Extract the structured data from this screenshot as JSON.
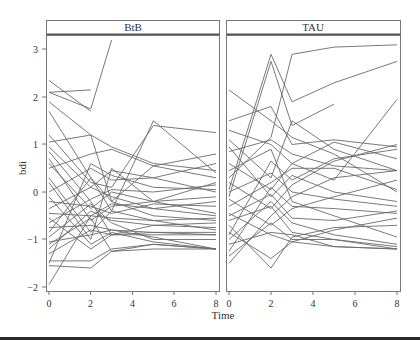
{
  "chart_data": {
    "type": "line",
    "title": "",
    "xlabel": "Time",
    "ylabel": "bdi",
    "xlim": [
      0,
      8
    ],
    "ylim": [
      -2.1,
      3.3
    ],
    "xticks": [
      0,
      2,
      4,
      6,
      8
    ],
    "yticks": [
      -2,
      -1,
      0,
      1,
      2,
      3
    ],
    "grid": false,
    "legend": "none",
    "panels": [
      {
        "label": "BtB",
        "x": [
          0,
          2,
          3,
          5,
          8
        ],
        "series": [
          [
            2.1,
            1.75,
            3.2,
            null,
            null
          ],
          [
            2.35,
            1.7,
            null,
            null,
            null
          ],
          [
            2.1,
            2.15,
            null,
            null,
            null
          ],
          [
            1.9,
            1.2,
            0.95,
            0.6,
            0.45
          ],
          [
            1.7,
            0.3,
            -0.4,
            1.5,
            0.4
          ],
          [
            1.2,
            0.2,
            0.1,
            1.4,
            1.25
          ],
          [
            1.05,
            1.2,
            -0.2,
            0.55,
            0.3
          ],
          [
            0.85,
            -0.2,
            -0.9,
            -0.7,
            -0.75
          ],
          [
            0.7,
            -0.6,
            -0.3,
            -0.2,
            -0.1
          ],
          [
            0.5,
            0.8,
            0.9,
            0.55,
            0.8
          ],
          [
            0.3,
            -0.85,
            -0.4,
            -0.6,
            -0.8
          ],
          [
            0.2,
            -1.0,
            0.5,
            -0.2,
            0.2
          ],
          [
            0.0,
            0.5,
            0.25,
            0.3,
            0.0
          ],
          [
            -0.1,
            -1.1,
            -0.85,
            -1.05,
            -1.2
          ],
          [
            -0.2,
            -0.3,
            -0.45,
            -0.25,
            -0.3
          ],
          [
            -0.35,
            0.1,
            -0.1,
            -0.35,
            -0.5
          ],
          [
            -0.45,
            -0.5,
            -0.55,
            -0.6,
            -0.55
          ],
          [
            -0.55,
            -1.2,
            -0.9,
            -0.9,
            -0.9
          ],
          [
            -0.65,
            -0.15,
            0.05,
            0.0,
            0.15
          ],
          [
            -0.75,
            -0.7,
            -0.8,
            -0.85,
            -0.9
          ],
          [
            -0.85,
            0.3,
            -0.2,
            -0.5,
            -0.6
          ],
          [
            -0.95,
            -0.25,
            -0.65,
            -1.0,
            -1.0
          ],
          [
            -1.05,
            -0.9,
            -0.8,
            -0.95,
            -1.2
          ],
          [
            -1.1,
            -0.55,
            -1.25,
            -1.1,
            -1.2
          ],
          [
            -1.2,
            -0.4,
            -0.6,
            -0.7,
            -0.65
          ],
          [
            -1.3,
            -0.8,
            -0.9,
            -0.85,
            -0.85
          ],
          [
            -1.45,
            -1.45,
            -1.2,
            -1.1,
            -1.2
          ],
          [
            -1.55,
            -1.6,
            -1.25,
            -1.2,
            -1.2
          ],
          [
            -1.5,
            0.6,
            0.35,
            0.1,
            0.05
          ],
          [
            -1.95,
            -0.5,
            -0.25,
            -0.35,
            -0.2
          ],
          [
            0.6,
            -0.35,
            0.0,
            -0.2,
            -0.45
          ],
          [
            0.95,
            0.1,
            0.45,
            0.3,
            0.6
          ]
        ]
      },
      {
        "label": "TAU",
        "x": [
          0,
          2,
          3,
          5,
          8
        ],
        "series": [
          [
            0.3,
            1.15,
            2.9,
            3.05,
            3.1
          ],
          [
            0.05,
            2.9,
            1.9,
            2.3,
            2.75
          ],
          [
            -0.1,
            2.75,
            1.4,
            1.85,
            null
          ],
          [
            2.15,
            1.5,
            1.15,
            0.8,
            0.0
          ],
          [
            1.5,
            1.8,
            1.0,
            1.1,
            0.95
          ],
          [
            1.3,
            1.0,
            0.6,
            0.25,
            1.95
          ],
          [
            1.1,
            0.3,
            1.5,
            0.9,
            0.45
          ],
          [
            0.85,
            1.1,
            0.8,
            0.55,
            0.45
          ],
          [
            0.6,
            0.05,
            0.6,
            1.05,
            0.7
          ],
          [
            0.45,
            0.9,
            -0.2,
            -0.5,
            -0.95
          ],
          [
            0.2,
            -0.35,
            0.15,
            0.65,
            1.0
          ],
          [
            0.0,
            0.4,
            0.0,
            -0.15,
            -0.3
          ],
          [
            -0.15,
            -0.7,
            -0.35,
            -0.1,
            0.25
          ],
          [
            -0.3,
            0.2,
            0.5,
            0.5,
            0.05
          ],
          [
            -0.45,
            -0.9,
            -1.05,
            -1.15,
            -1.2
          ],
          [
            -0.6,
            -0.3,
            -0.85,
            -1.0,
            -1.15
          ],
          [
            -0.7,
            -1.6,
            -0.95,
            -0.75,
            -0.7
          ],
          [
            -0.85,
            -1.4,
            -1.05,
            -0.8,
            -0.55
          ],
          [
            -1.0,
            -0.2,
            -0.65,
            -0.9,
            -1.1
          ],
          [
            -1.1,
            -0.85,
            -0.9,
            -1.15,
            -1.2
          ],
          [
            -1.25,
            0.1,
            -0.3,
            -0.35,
            -0.45
          ],
          [
            -1.35,
            -0.65,
            -1.0,
            -1.0,
            -1.2
          ],
          [
            -1.5,
            -0.5,
            -0.1,
            0.3,
            0.45
          ],
          [
            -0.5,
            -0.05,
            -0.55,
            -0.6,
            -0.4
          ],
          [
            0.95,
            -0.1,
            0.35,
            0.0,
            -0.2
          ],
          [
            -0.9,
            0.65,
            0.25,
            0.7,
            0.9
          ]
        ]
      }
    ]
  },
  "labels": {
    "panel_left": "BtB",
    "panel_right": "TAU",
    "xlabel": "Time",
    "ylabel": "bdi",
    "yticks": [
      "3",
      "2",
      "1",
      "0",
      "−1",
      "−2"
    ],
    "xticks": [
      "0",
      "2",
      "4",
      "6",
      "8"
    ]
  }
}
